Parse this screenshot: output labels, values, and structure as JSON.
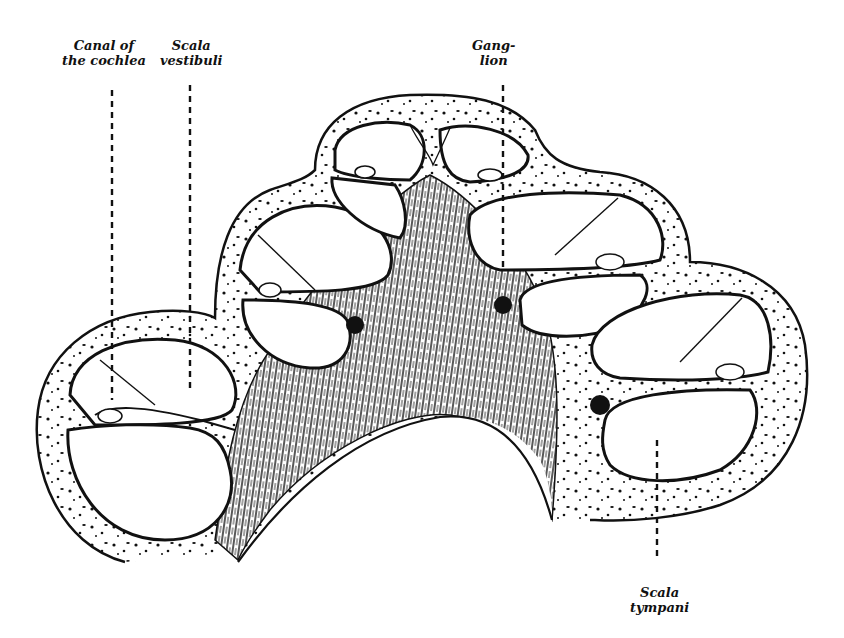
{
  "figure": {
    "type": "anatomical-illustration",
    "colors": {
      "ink": "#111111",
      "background": "#ffffff"
    }
  },
  "labels": [
    {
      "id": "canal-of-the-cochlea",
      "lines": [
        "Canal of",
        "the cochlea"
      ]
    },
    {
      "id": "scala-vestibuli",
      "lines": [
        "Scala",
        "vestibuli"
      ]
    },
    {
      "id": "ganglion",
      "lines": [
        "Gang-",
        "lion"
      ]
    },
    {
      "id": "scala-tympani",
      "lines": [
        "Scala",
        "tympani"
      ]
    }
  ]
}
